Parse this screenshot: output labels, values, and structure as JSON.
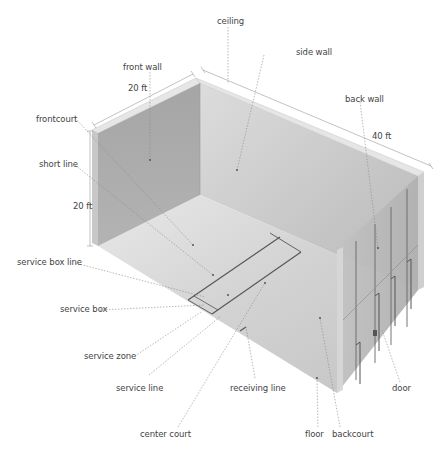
{
  "diagram": {
    "dimensions": {
      "front_wall_width": "20 ft",
      "height": "20 ft",
      "length": "40 ft"
    },
    "labels": {
      "ceiling": "ceiling",
      "front_wall": "front wall",
      "side_wall": "side wall",
      "back_wall": "back wall",
      "frontcourt": "frontcourt",
      "short_line": "short line",
      "service_box_line": "service box line",
      "service_box": "service box",
      "service_zone": "service zone",
      "service_line": "service line",
      "receiving_line": "receiving line",
      "center_court": "center court",
      "floor": "floor",
      "backcourt": "backcourt",
      "door": "door"
    },
    "colors": {
      "front_wall": "#a9a9a9",
      "side_wall": "#c9c9c9",
      "floor": "#d6d6d6",
      "back_wall": "#bdbdbd",
      "wall_edge": "#e4e4e4",
      "court_line": "#555555",
      "leader_line": "#8a8a8a",
      "label_text": "#444444"
    }
  }
}
